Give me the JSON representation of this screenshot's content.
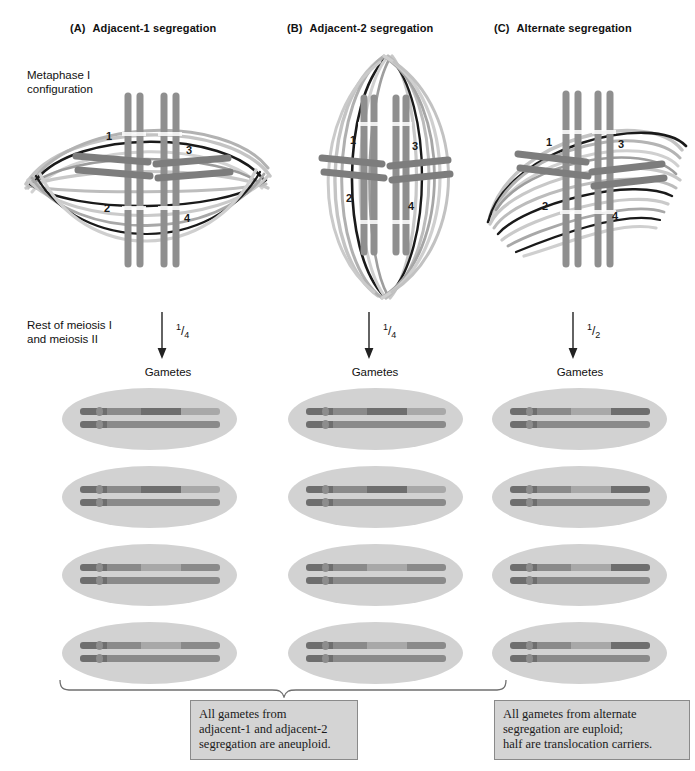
{
  "panels": [
    {
      "letter": "(A)",
      "title": "Adjacent-1 segregation",
      "fraction_num": "1",
      "fraction_den": "4",
      "gametes_label": "Gametes"
    },
    {
      "letter": "(B)",
      "title": "Adjacent-2 segregation",
      "fraction_num": "1",
      "fraction_den": "4",
      "gametes_label": "Gametes"
    },
    {
      "letter": "(C)",
      "title": "Alternate segregation",
      "fraction_num": "1",
      "fraction_den": "2",
      "gametes_label": "Gametes"
    }
  ],
  "labels": {
    "metaphase": "Metaphase I\nconfiguration",
    "rest_of_meiosis": "Rest of meiosis I\nand meiosis II"
  },
  "chromosome_numbers": [
    "1",
    "2",
    "3",
    "4"
  ],
  "captions": {
    "left": "All gametes from\nadjacent-1 and adjacent-2\nsegregation are aneuploid.",
    "right": "All gametes from alternate\nsegregation are euploid;\nhalf are translocation carriers."
  },
  "colors": {
    "cell_fill": "#d2d2d2",
    "chromosome_dark": "#6e6e6e",
    "chromosome_mid": "#8a8a8a",
    "chromosome_light": "#a8a8a8",
    "spindle_light": "#c0c0c0",
    "spindle_mid": "#9a9a9a",
    "spindle_dark": "#111111",
    "caption_bg": "#d4d4d4",
    "caption_border": "#8a8a8a"
  },
  "gametes": {
    "column_a": [
      {
        "top": [
          "dark",
          "mid",
          "dark",
          "light"
        ],
        "bottom": [
          "dark",
          "mid",
          "mid",
          "mid"
        ]
      },
      {
        "top": [
          "dark",
          "mid",
          "dark",
          "light"
        ],
        "bottom": [
          "dark",
          "mid",
          "mid",
          "mid"
        ]
      },
      {
        "top": [
          "dark",
          "mid",
          "light",
          "mid"
        ],
        "bottom": [
          "dark",
          "mid",
          "mid",
          "mid"
        ]
      },
      {
        "top": [
          "dark",
          "mid",
          "light",
          "mid"
        ],
        "bottom": [
          "dark",
          "mid",
          "mid",
          "mid"
        ]
      }
    ],
    "column_b": [
      {
        "top": [
          "dark",
          "mid",
          "dark",
          "light"
        ],
        "bottom": [
          "dark",
          "mid",
          "mid",
          "mid"
        ]
      },
      {
        "top": [
          "dark",
          "mid",
          "dark",
          "light"
        ],
        "bottom": [
          "dark",
          "mid",
          "mid",
          "mid"
        ]
      },
      {
        "top": [
          "dark",
          "mid",
          "light",
          "mid"
        ],
        "bottom": [
          "dark",
          "mid",
          "mid",
          "mid"
        ]
      },
      {
        "top": [
          "dark",
          "mid",
          "light",
          "mid"
        ],
        "bottom": [
          "dark",
          "mid",
          "mid",
          "mid"
        ]
      }
    ],
    "column_c": [
      {
        "top": [
          "dark",
          "mid",
          "light",
          "dark"
        ],
        "bottom": [
          "dark",
          "mid",
          "mid",
          "mid"
        ]
      },
      {
        "top": [
          "dark",
          "mid",
          "light",
          "dark"
        ],
        "bottom": [
          "dark",
          "mid",
          "mid",
          "mid"
        ]
      },
      {
        "top": [
          "dark",
          "mid",
          "light",
          "dark"
        ],
        "bottom": [
          "dark",
          "mid",
          "mid",
          "mid"
        ]
      },
      {
        "top": [
          "dark",
          "mid",
          "light",
          "dark"
        ],
        "bottom": [
          "dark",
          "mid",
          "mid",
          "mid"
        ]
      }
    ]
  }
}
